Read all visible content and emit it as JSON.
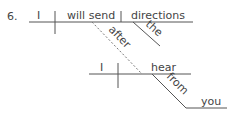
{
  "item_number": "6.",
  "main_clause": {
    "subject": "I",
    "verb": "will send",
    "direct_object": "directions",
    "object_modifier": "the"
  },
  "connector": "after",
  "sub_clause": {
    "subject": "I",
    "verb": "hear",
    "preposition": "from",
    "prep_object": "you"
  },
  "colors": {
    "line": "#555555",
    "text": "#444444",
    "background": "#ffffff"
  }
}
